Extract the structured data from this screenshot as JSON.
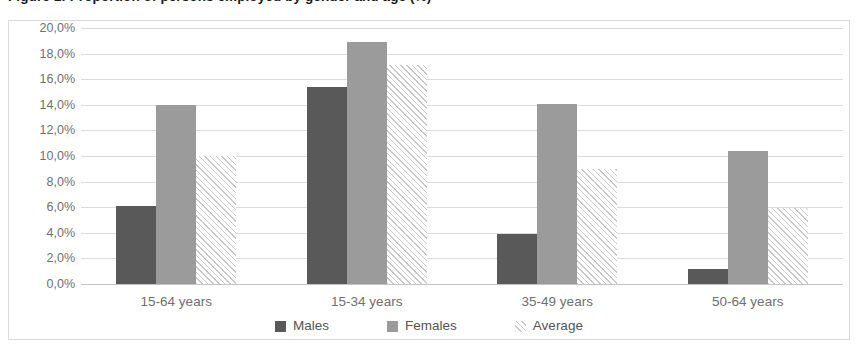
{
  "figure": {
    "title": "Figure 1: Proportion of persons employed by gender and age (%)",
    "title_visible_note": "clipped at top edge"
  },
  "chart_data": {
    "type": "bar",
    "title": "Figure 1: Proportion of persons employed by gender and age (%)",
    "xlabel": "",
    "ylabel": "",
    "categories": [
      "15-64 years",
      "15-34 years",
      "35-49 years",
      "50-64 years"
    ],
    "series": [
      {
        "name": "Males",
        "values": [
          6.1,
          15.4,
          3.9,
          1.2
        ]
      },
      {
        "name": "Females",
        "values": [
          14.0,
          18.9,
          14.1,
          10.4
        ]
      },
      {
        "name": "Average",
        "values": [
          10.0,
          17.1,
          9.0,
          5.9
        ]
      }
    ],
    "ylim": [
      0,
      20
    ],
    "ytick_step": 2,
    "ytick_labels": [
      "20,0%",
      "18,0%",
      "16,0%",
      "14,0%",
      "12,0%",
      "10,0%",
      "8,0%",
      "6,0%",
      "4,0%",
      "2,0%",
      "0,0%"
    ],
    "ytick_values": [
      20,
      18,
      16,
      14,
      12,
      10,
      8,
      6,
      4,
      2,
      0
    ],
    "grid": true,
    "legend_position": "bottom",
    "colors": {
      "males": "#595959",
      "females": "#9b9b9b",
      "average": "#ffffff",
      "average_hatch": "#c9c9c9",
      "gridline": "#dcdcdc",
      "frame": "#d9d9d9",
      "tick_label": "#6f6f6f",
      "legend_label": "#555555"
    }
  },
  "legend": {
    "items": [
      {
        "label": "Males",
        "key": "males"
      },
      {
        "label": "Females",
        "key": "females"
      },
      {
        "label": "Average",
        "key": "average"
      }
    ]
  }
}
